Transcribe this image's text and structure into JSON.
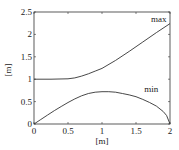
{
  "chart_data": {
    "type": "line",
    "title": "",
    "xlabel": "[m]",
    "ylabel": "[m]",
    "xlim": [
      0,
      2
    ],
    "ylim": [
      0,
      2.5
    ],
    "grid": false,
    "x_ticks": [
      "0",
      "0.5",
      "1",
      "1.5",
      "2"
    ],
    "y_ticks": [
      "0",
      "0.5",
      "1",
      "1.5",
      "2",
      "2.5"
    ],
    "series": [
      {
        "name": "max",
        "x": [
          0,
          0.25,
          0.5,
          0.6,
          0.7,
          0.8,
          0.9,
          1.0,
          1.2,
          1.4,
          1.6,
          1.8,
          2.0
        ],
        "values": [
          1.0,
          1.0,
          1.01,
          1.03,
          1.07,
          1.12,
          1.18,
          1.24,
          1.42,
          1.62,
          1.83,
          2.04,
          2.24
        ]
      },
      {
        "name": "min",
        "x": [
          0,
          0.1,
          0.2,
          0.3,
          0.4,
          0.5,
          0.6,
          0.7,
          0.8,
          0.9,
          1.0,
          1.1,
          1.2,
          1.3,
          1.4,
          1.5,
          1.6,
          1.7,
          1.8,
          1.9,
          1.95,
          2.0
        ],
        "values": [
          0,
          0.1,
          0.2,
          0.3,
          0.39,
          0.48,
          0.56,
          0.63,
          0.68,
          0.71,
          0.72,
          0.72,
          0.71,
          0.68,
          0.65,
          0.61,
          0.55,
          0.48,
          0.4,
          0.28,
          0.19,
          0.0
        ]
      }
    ],
    "annotations": [
      {
        "text": "max",
        "x": 1.72,
        "y": 2.28
      },
      {
        "text": "min",
        "x": 1.62,
        "y": 0.72
      }
    ]
  }
}
